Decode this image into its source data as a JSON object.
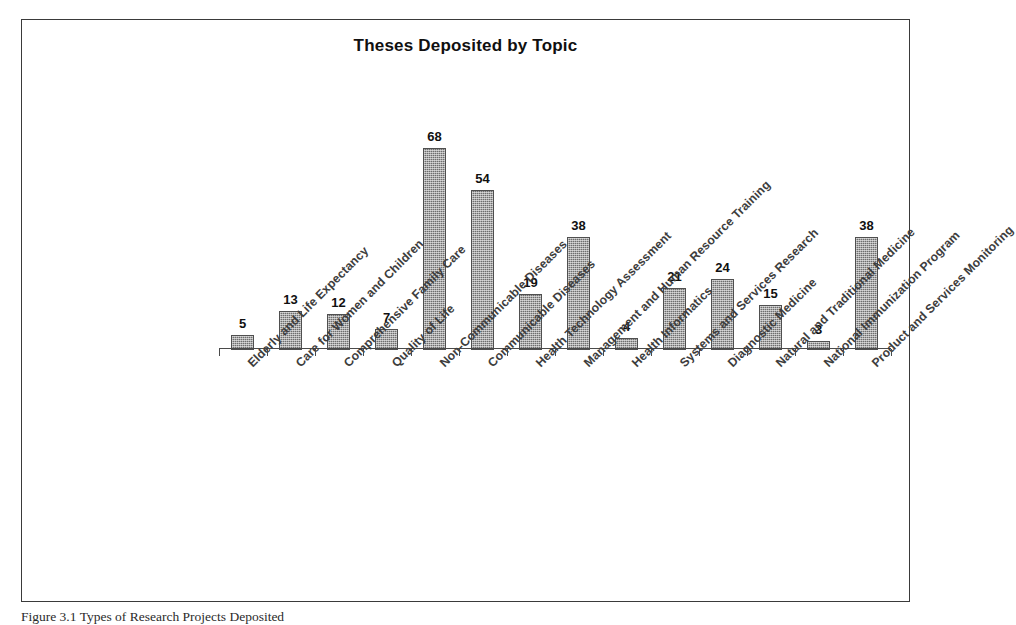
{
  "figure": {
    "caption": "Figure 3.1 Types of Research Projects Deposited"
  },
  "chart_data": {
    "type": "bar",
    "title": "Theses Deposited by Topic",
    "xlabel": "",
    "ylabel": "",
    "ylim": [
      0,
      72
    ],
    "grid": false,
    "legend": null,
    "bar_color": "#6e6e6e",
    "show_value_labels": true,
    "categories": [
      "Elderly and Life Expectancy",
      "Care for Women and Children",
      "Comprehensive Family Care",
      "Quality of Life",
      "Non-Communicable Diseases",
      "Communicable Diseases",
      "Health Technology Assessment",
      "Management and Human Resource Training",
      "Health Informatics",
      "Systems and Services Research",
      "Diagnostic Medicine",
      "Natural and Traditional Medicine",
      "National Immunization Program",
      "Product and Services Monitoring"
    ],
    "values": [
      5,
      13,
      12,
      7,
      68,
      54,
      19,
      38,
      4,
      21,
      24,
      15,
      3,
      38
    ]
  }
}
